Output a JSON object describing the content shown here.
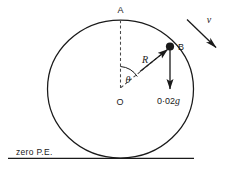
{
  "figure": {
    "labels": {
      "top_point": "A",
      "particle_point": "B",
      "centre_point": "O",
      "radius": "R",
      "angle": "θ",
      "velocity": "v",
      "weight_value": "0·02",
      "weight_unit": "g",
      "datum": "zero P.E."
    },
    "colors": {
      "ink": "#1a1a1a",
      "dashed": "#4a4a4a",
      "background": "#ffffff"
    },
    "geometry": {
      "centre_x": 120,
      "centre_y": 89,
      "radius_x": 73,
      "radius_y": 69,
      "top_y": 20,
      "bottom_y": 158,
      "particle_x": 170,
      "particle_y": 47,
      "ground_y": 158,
      "ground_x_start": 8,
      "ground_x_end": 194,
      "angle_degrees": 43
    }
  }
}
